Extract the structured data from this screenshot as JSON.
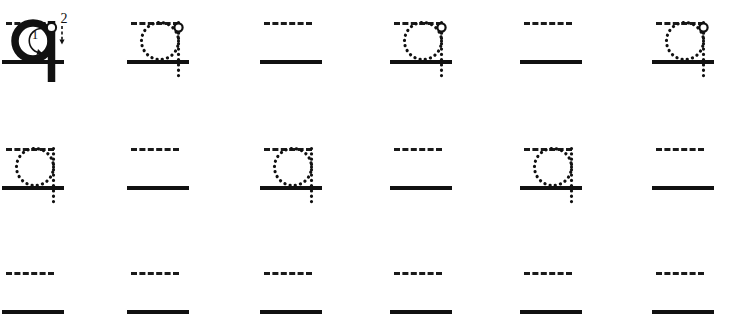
{
  "worksheet": {
    "letter": "q",
    "letter_case": "lowercase",
    "type": "handwriting-tracing-worksheet",
    "background_color": "#ffffff",
    "line_color": "#111111",
    "glyph_color": "#111111",
    "columns": 6,
    "rows": 3,
    "stroke_numbers": [
      "1",
      "2"
    ],
    "rows_data": [
      {
        "name": "row-1",
        "midline_y": 22,
        "baseline_y": 60,
        "cells": [
          {
            "name": "model-letter-cell",
            "content": "model-solid",
            "letter": "q",
            "stroke_labels": [
              "1",
              "2"
            ],
            "has_start_dot": true
          },
          {
            "name": "trace-cell",
            "content": "trace-dotted",
            "letter": "q",
            "has_start_dot": true
          },
          {
            "name": "blank-cell",
            "content": "blank",
            "letter": ""
          },
          {
            "name": "trace-cell",
            "content": "trace-dotted",
            "letter": "q",
            "has_start_dot": true
          },
          {
            "name": "blank-cell",
            "content": "blank",
            "letter": ""
          },
          {
            "name": "trace-cell",
            "content": "trace-dotted",
            "letter": "q",
            "has_start_dot": true
          }
        ]
      },
      {
        "name": "row-2",
        "midline_y": 148,
        "baseline_y": 186,
        "cells": [
          {
            "name": "trace-cell",
            "content": "trace-dotted",
            "letter": "q",
            "has_start_dot": false
          },
          {
            "name": "blank-cell",
            "content": "blank",
            "letter": ""
          },
          {
            "name": "trace-cell",
            "content": "trace-dotted",
            "letter": "q",
            "has_start_dot": false
          },
          {
            "name": "blank-cell",
            "content": "blank",
            "letter": ""
          },
          {
            "name": "trace-cell",
            "content": "trace-dotted",
            "letter": "q",
            "has_start_dot": false
          },
          {
            "name": "blank-cell",
            "content": "blank",
            "letter": ""
          }
        ]
      },
      {
        "name": "row-3",
        "midline_y": 272,
        "baseline_y": 310,
        "cells": [
          {
            "name": "blank-cell",
            "content": "blank",
            "letter": ""
          },
          {
            "name": "blank-cell",
            "content": "blank",
            "letter": ""
          },
          {
            "name": "blank-cell",
            "content": "blank",
            "letter": ""
          },
          {
            "name": "blank-cell",
            "content": "blank",
            "letter": ""
          },
          {
            "name": "blank-cell",
            "content": "blank",
            "letter": ""
          },
          {
            "name": "blank-cell",
            "content": "blank",
            "letter": ""
          }
        ]
      }
    ],
    "column_x": [
      2,
      127,
      260,
      390,
      520,
      652
    ],
    "cell_width": 62,
    "midline_width": 48
  }
}
